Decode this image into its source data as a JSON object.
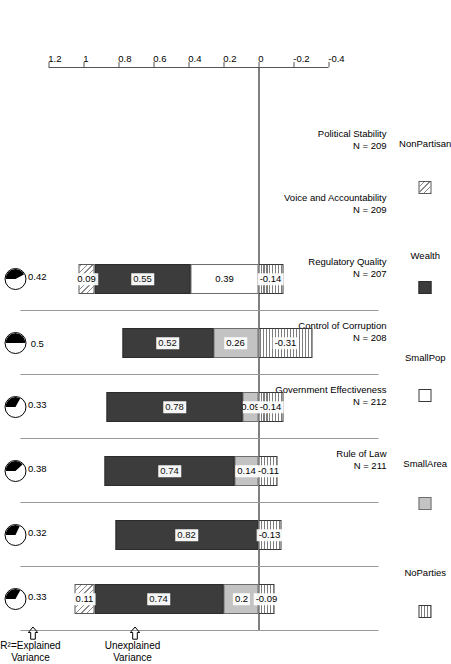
{
  "chart_data": {
    "type": "bar",
    "orientation": "stacked-vertical-rotated",
    "title": "",
    "xlabel": "",
    "ylabel": "",
    "ylim": [
      -0.4,
      1.2
    ],
    "yticks": [
      "-0.4",
      "-0.2",
      "0",
      "0.2",
      "0.4",
      "0.6",
      "0.8",
      "1",
      "1.2"
    ],
    "ytick_values": [
      -0.4,
      -0.2,
      0,
      0.2,
      0.4,
      0.6,
      0.8,
      1.0,
      1.2
    ],
    "grid": false,
    "legend_position": "bottom",
    "categories": [
      "Rule of Law",
      "Government Effectiveness",
      "Control of Corruption",
      "Regulatory Quality",
      "Voice and Accountability",
      "Political Stability"
    ],
    "category_sublabels": [
      "N = 211",
      "N = 212",
      "N = 208",
      "N = 207",
      "N = 209",
      "N = 209"
    ],
    "series": [
      {
        "name": "NoParties",
        "values": [
          -0.09,
          -0.13,
          -0.11,
          -0.14,
          -0.31,
          -0.14
        ]
      },
      {
        "name": "SmallArea",
        "values": [
          0.2,
          null,
          0.14,
          0.09,
          0.26,
          null
        ]
      },
      {
        "name": "SmallPop",
        "values": [
          null,
          null,
          null,
          null,
          null,
          0.39
        ]
      },
      {
        "name": "Wealth",
        "values": [
          0.74,
          0.82,
          0.74,
          0.78,
          0.52,
          0.55
        ]
      },
      {
        "name": "NonPartisan",
        "values": [
          0.11,
          null,
          null,
          null,
          null,
          0.09
        ]
      }
    ],
    "explained_variance": [
      0.67,
      0.68,
      0.62,
      0.67,
      0.5,
      0.58
    ],
    "unexplained_variance": [
      0.33,
      0.32,
      0.38,
      0.33,
      0.5,
      0.42
    ]
  },
  "annotations": {
    "explained_header_line1": "R²=Explained",
    "explained_header_line2": "Variance",
    "unexplained_header_line1": "Unexplained",
    "unexplained_header_line2": "Variance",
    "arrow_explained": "arrow-right-icon",
    "arrow_unexplained": "arrow-right-icon"
  },
  "legend": {
    "items": [
      {
        "label": "NoParties",
        "swatch": "noparties-swatch-icon",
        "color": "#ffffff"
      },
      {
        "label": "SmallArea",
        "swatch": "smallarea-swatch-icon",
        "color": "#c3c3c3"
      },
      {
        "label": "SmallPop",
        "swatch": "smallpop-swatch-icon",
        "color": "#ffffff"
      },
      {
        "label": "Wealth",
        "swatch": "wealth-swatch-icon",
        "color": "#3c3c3c"
      },
      {
        "label": "NonPartisan",
        "swatch": "nonpartisan-swatch-icon",
        "color": "#ffffff"
      }
    ]
  },
  "axis": {
    "tick_labels": [
      "-0.4",
      "-0.2",
      "0",
      "0.2",
      "0.4",
      "0.6",
      "0.8",
      "1",
      "1.2"
    ]
  },
  "segment_labels": {
    "rule_of_law": {
      "noparties": "-0.09",
      "smallarea": "0.2",
      "wealth": "0.74",
      "nonpartisan": "0.11"
    },
    "government_effectiveness": {
      "noparties": "-0.13",
      "wealth": "0.82"
    },
    "control_of_corruption": {
      "noparties": "-0.11",
      "smallarea": "0.14",
      "wealth": "0.74"
    },
    "regulatory_quality": {
      "noparties": "-0.14",
      "smallarea": "0.09",
      "wealth": "0.78"
    },
    "voice_and_accountability": {
      "noparties": "-0.31",
      "smallarea": "0.26",
      "wealth": "0.52"
    },
    "political_stability": {
      "noparties": "-0.14",
      "smallpop": "0.39",
      "wealth": "0.55",
      "nonpartisan": "0.09"
    }
  },
  "pie_labels": {
    "explained": [
      "0.67",
      "0.68",
      "0.62",
      "0.67",
      "0.5",
      "0.58"
    ],
    "unexplained": [
      "0.33",
      "0.32",
      "0.38",
      "0.33",
      "0.5",
      "0.42"
    ]
  }
}
